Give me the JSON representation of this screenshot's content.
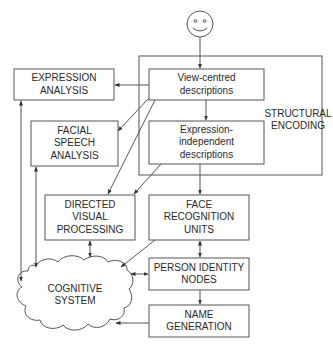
{
  "diagram": {
    "colors": {
      "stroke": "#555555",
      "text": "#2a2a2a",
      "background": "#ffffff"
    },
    "input_icon": "smiley-face-icon",
    "nodes": {
      "structural_encoding": {
        "lines": [
          "STRUCTURAL",
          "ENCODING"
        ]
      },
      "view_centred": {
        "lines": [
          "View-centred",
          "descriptions"
        ]
      },
      "expression_independent": {
        "lines": [
          "Expression-",
          "independent",
          "descriptions"
        ]
      },
      "expression_analysis": {
        "lines": [
          "EXPRESSION",
          "ANALYSIS"
        ]
      },
      "facial_speech_analysis": {
        "lines": [
          "FACIAL",
          "SPEECH",
          "ANALYSIS"
        ]
      },
      "directed_visual_processing": {
        "lines": [
          "DIRECTED",
          "VISUAL",
          "PROCESSING"
        ]
      },
      "face_recognition_units": {
        "lines": [
          "FACE",
          "RECOGNITION",
          "UNITS"
        ]
      },
      "person_identity_nodes": {
        "lines": [
          "PERSON IDENTITY",
          "NODES"
        ]
      },
      "name_generation": {
        "lines": [
          "NAME",
          "GENERATION"
        ]
      },
      "cognitive_system": {
        "lines": [
          "COGNITIVE",
          "SYSTEM"
        ]
      }
    },
    "edges": [
      {
        "from": "face",
        "to": "view_centred",
        "type": "one-way"
      },
      {
        "from": "view_centred",
        "to": "expression_independent",
        "type": "one-way"
      },
      {
        "from": "view_centred",
        "to": "expression_analysis",
        "type": "one-way"
      },
      {
        "from": "view_centred",
        "to": "facial_speech_analysis",
        "type": "one-way"
      },
      {
        "from": "view_centred",
        "to": "directed_visual_processing",
        "type": "one-way"
      },
      {
        "from": "expression_independent",
        "to": "directed_visual_processing",
        "type": "one-way"
      },
      {
        "from": "expression_independent",
        "to": "face_recognition_units",
        "type": "one-way"
      },
      {
        "from": "face_recognition_units",
        "to": "person_identity_nodes",
        "type": "two-way"
      },
      {
        "from": "person_identity_nodes",
        "to": "name_generation",
        "type": "one-way"
      },
      {
        "from": "face_recognition_units",
        "to": "cognitive_system",
        "type": "one-way"
      },
      {
        "from": "person_identity_nodes",
        "to": "cognitive_system",
        "type": "two-way"
      },
      {
        "from": "name_generation",
        "to": "cognitive_system",
        "type": "one-way"
      },
      {
        "from": "directed_visual_processing",
        "to": "cognitive_system",
        "type": "two-way"
      },
      {
        "from": "expression_analysis",
        "to": "cognitive_system",
        "type": "two-way"
      },
      {
        "from": "facial_speech_analysis",
        "to": "cognitive_system",
        "type": "two-way"
      }
    ]
  }
}
